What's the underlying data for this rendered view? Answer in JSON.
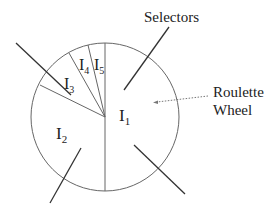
{
  "labels": {
    "selectors": "Selectors",
    "roulette_line1": "Roulette",
    "roulette_line2": "Wheel"
  },
  "segments": [
    {
      "id": "I1",
      "base": "I",
      "sub": "1"
    },
    {
      "id": "I2",
      "base": "I",
      "sub": "2"
    },
    {
      "id": "I3",
      "base": "I",
      "sub": "3"
    },
    {
      "id": "I4",
      "base": "I",
      "sub": "4"
    },
    {
      "id": "I5",
      "base": "I",
      "sub": "5"
    }
  ],
  "colors": {
    "line": "#555555",
    "arrow": "#333333",
    "dotted": "#777777"
  }
}
